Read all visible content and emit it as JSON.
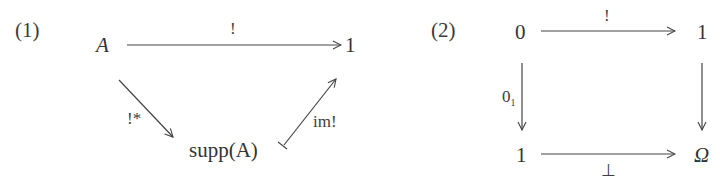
{
  "diagrams": [
    {
      "label": "(1)",
      "objects": {
        "source": "A",
        "terminal": "1",
        "support": "supp(A)"
      },
      "arrows": {
        "top": {
          "label": "!",
          "from": "A",
          "to": "1"
        },
        "down_left": {
          "label": "!*",
          "from": "A",
          "to": "supp(A)"
        },
        "up_right": {
          "label": "im!",
          "from": "supp(A)",
          "to": "1",
          "style": "mono"
        }
      }
    },
    {
      "label": "(2)",
      "objects": {
        "top_left": "0",
        "top_right": "1",
        "bottom_left": "1",
        "bottom_right": "Ω"
      },
      "arrows": {
        "top": {
          "label": "!",
          "from": "0",
          "to": "1"
        },
        "left": {
          "label": "0",
          "subscript": "1",
          "from": "0",
          "to": "1"
        },
        "right": {
          "label": "",
          "from": "1",
          "to": "Ω"
        },
        "bottom": {
          "label": "⊥",
          "from": "1",
          "to": "Ω"
        }
      }
    }
  ],
  "colors": {
    "ink": "#333333",
    "background": "#ffffff"
  }
}
